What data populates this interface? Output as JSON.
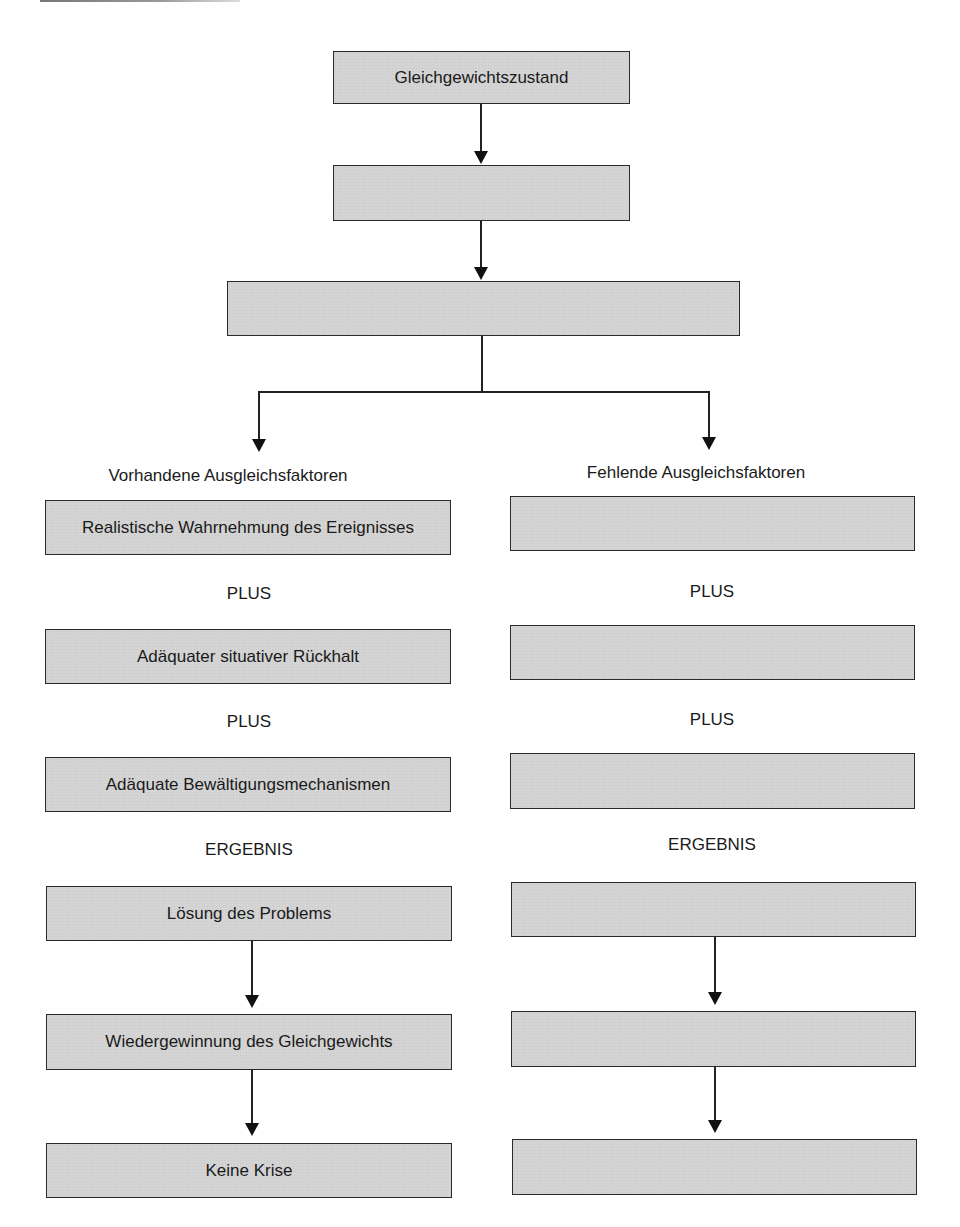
{
  "diagram": {
    "top": {
      "equilibrium": "Gleichgewichtszustand",
      "box2": "",
      "box3": ""
    },
    "left": {
      "heading": "Vorhandene Ausgleichsfaktoren",
      "boxes": [
        "Realistische Wahrnehmung des Ereignisses",
        "Adäquater situativer Rückhalt",
        "Adäquate Bewältigungsmechanismen",
        "Lösung des Problems",
        "Wiedergewinnung des Gleichgewichts",
        "Keine Krise"
      ],
      "connectors": [
        "PLUS",
        "PLUS",
        "ERGEBNIS"
      ]
    },
    "right": {
      "heading": "Fehlende Ausgleichsfaktoren",
      "boxes": [
        "",
        "",
        "",
        "",
        "",
        ""
      ],
      "connectors": [
        "PLUS",
        "PLUS",
        "ERGEBNIS"
      ]
    },
    "colors": {
      "box_fill": "#d4d4d4",
      "border": "#2a2a2a",
      "text": "#1a1a1a"
    }
  }
}
